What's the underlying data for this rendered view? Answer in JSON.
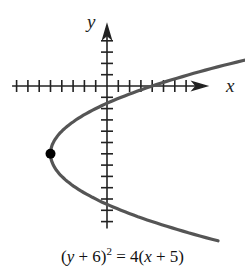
{
  "chart_data": {
    "type": "line",
    "title": "",
    "equation": "(y + 6)^2 = 4(x + 5)",
    "caption_parts": {
      "open": "(",
      "y": "y",
      "plus6": " + 6)",
      "sup": "2",
      "eq": " = 4(",
      "x": "x",
      "plus5": " + 5)"
    },
    "xlabel": "x",
    "ylabel": "y",
    "xlim": [
      -8,
      9
    ],
    "ylim": [
      -13,
      5
    ],
    "x_ticks": [
      -8,
      -7,
      -6,
      -5,
      -4,
      -3,
      -2,
      -1,
      1,
      2,
      3,
      4,
      5,
      6,
      7
    ],
    "y_ticks": [
      4,
      3,
      2,
      1,
      -1,
      -2,
      -3,
      -4,
      -5,
      -6,
      -7,
      -8,
      -9,
      -10,
      -11,
      -12
    ],
    "grid": false,
    "tick_labels_shown": false,
    "curve": {
      "kind": "parabola",
      "opens": "right",
      "vertex": [
        -5,
        -6
      ],
      "y_range": [
        -13.7,
        3.4
      ]
    },
    "points": [
      {
        "label": "vertex",
        "x": -5,
        "y": -6
      }
    ],
    "colors": {
      "curve": "#555555",
      "axes": "#222222",
      "vertex": "#000000"
    }
  }
}
